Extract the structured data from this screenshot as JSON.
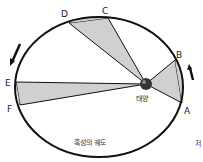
{
  "diagram": {
    "orbit_label": "혹성의 궤도",
    "sun_label": "태양",
    "side_text": "저",
    "points": {
      "A": "A",
      "B": "B",
      "C": "C",
      "D": "D",
      "E": "E",
      "F": "F"
    },
    "colors": {
      "stroke": "#111111",
      "sector_fill": "#d0d0d0",
      "sun": "#333333"
    }
  }
}
